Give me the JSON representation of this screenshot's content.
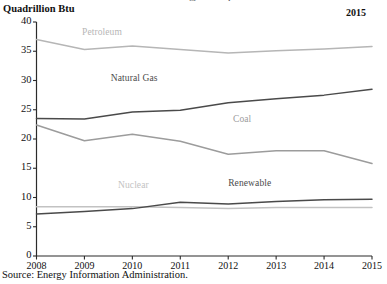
{
  "figure": {
    "clipped_header": "Sources of Energy Consumption",
    "y_axis_title": "Quadrillion Btu",
    "corner_annotation": "2015",
    "source_note": "Source: Energy Information Administration."
  },
  "chart_data": {
    "type": "line",
    "title": "",
    "xlabel": "",
    "ylabel": "Quadrillion Btu",
    "categories": [
      "2008",
      "2009",
      "2010",
      "2011",
      "2012",
      "2013",
      "2014",
      "2015"
    ],
    "x": [
      2008,
      2009,
      2010,
      2011,
      2012,
      2013,
      2014,
      2015
    ],
    "xlim": [
      2008,
      2015
    ],
    "ylim": [
      0,
      40
    ],
    "yticks": [
      0,
      5,
      10,
      15,
      20,
      25,
      30,
      35,
      40
    ],
    "ytick_labels": [
      "0",
      "5",
      "10",
      "15",
      "20",
      "25",
      "30",
      "35",
      "40"
    ],
    "grid": false,
    "legend": "inline-labels",
    "series": [
      {
        "name": "Petroleum",
        "color": "#b6b6b6",
        "label_x": 2008.95,
        "label_y": 38.2,
        "values": [
          37.0,
          35.3,
          35.9,
          35.3,
          34.7,
          35.1,
          35.4,
          35.8
        ]
      },
      {
        "name": "Natural Gas",
        "color": "#4a4a4a",
        "label_x": 2009.55,
        "label_y": 30.3,
        "values": [
          23.5,
          23.4,
          24.6,
          24.9,
          26.2,
          26.9,
          27.5,
          28.5
        ]
      },
      {
        "name": "Coal",
        "color": "#9c9c9c",
        "label_x": 2012.1,
        "label_y": 23.2,
        "values": [
          22.4,
          19.7,
          20.8,
          19.6,
          17.4,
          18.0,
          18.0,
          15.8
        ]
      },
      {
        "name": "Nuclear",
        "color": "#c2c2c2",
        "label_x": 2009.7,
        "label_y": 12.0,
        "values": [
          8.4,
          8.4,
          8.4,
          8.3,
          8.1,
          8.3,
          8.3,
          8.3
        ]
      },
      {
        "name": "Renewable",
        "color": "#4a4a4a",
        "label_x": 2012.0,
        "label_y": 12.3,
        "values": [
          7.2,
          7.6,
          8.1,
          9.2,
          8.9,
          9.3,
          9.6,
          9.7
        ]
      }
    ]
  }
}
